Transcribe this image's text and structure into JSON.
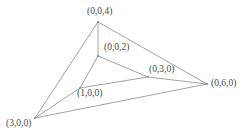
{
  "figure": {
    "background_color": "#ffffff",
    "line_color": "#8a8a8a",
    "label_color": "#4a4a4a",
    "vertices": {
      "apex_outer": {
        "label": "(0,0,4)",
        "x": 98,
        "y": 22
      },
      "apex_inner": {
        "label": "(0,0,2)",
        "x": 98,
        "y": 56
      },
      "right_inner": {
        "label": "(0,3,0)",
        "x": 148,
        "y": 77
      },
      "right_outer": {
        "label": "(0,6,0)",
        "x": 207,
        "y": 84
      },
      "front_inner": {
        "label": "(1,0,0)",
        "x": 80,
        "y": 88
      },
      "front_outer": {
        "label": "(3,0,0)",
        "x": 35,
        "y": 118
      }
    },
    "edges": [
      {
        "name": "outer-apex-to-front",
        "from": "apex_outer",
        "to": "front_outer"
      },
      {
        "name": "outer-apex-to-right",
        "from": "apex_outer",
        "to": "right_outer"
      },
      {
        "name": "outer-front-to-right",
        "from": "front_outer",
        "to": "right_outer"
      },
      {
        "name": "axis-vertical",
        "from": "apex_outer",
        "to": "apex_inner"
      },
      {
        "name": "axis-front",
        "from": "front_outer",
        "to": "front_inner"
      },
      {
        "name": "axis-right",
        "from": "right_outer",
        "to": "right_inner"
      },
      {
        "name": "inner-apex-to-front",
        "from": "apex_inner",
        "to": "front_inner"
      },
      {
        "name": "inner-apex-to-right",
        "from": "apex_inner",
        "to": "right_inner"
      },
      {
        "name": "inner-front-to-right",
        "from": "front_inner",
        "to": "right_inner"
      }
    ]
  }
}
